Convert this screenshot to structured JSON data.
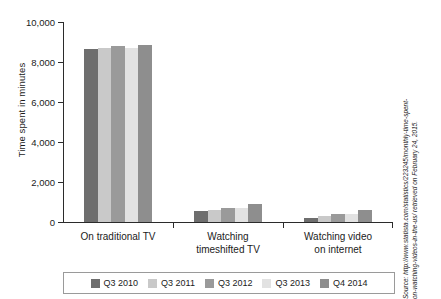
{
  "chart_data": {
    "type": "bar",
    "title": "",
    "xlabel": "",
    "ylabel": "Time spent in minutes",
    "ylim": [
      0,
      10000
    ],
    "yticks": [
      "0",
      "2,000",
      "4,000",
      "6,000",
      "8,000",
      "10,000"
    ],
    "ytick_values": [
      0,
      2000,
      4000,
      6000,
      8000,
      10000
    ],
    "grid": false,
    "legend_position": "bottom",
    "categories": [
      "On traditional TV",
      "Watching timeshifted TV",
      "Watching video on internet"
    ],
    "category_lines": [
      [
        "On traditional TV"
      ],
      [
        "Watching",
        "timeshifted TV"
      ],
      [
        "Watching video",
        "on internet"
      ]
    ],
    "series": [
      {
        "name": "Q3 2010",
        "color": "#6e6e6e",
        "values": [
          8650,
          540,
          190
        ]
      },
      {
        "name": "Q3 2011",
        "color": "#c9c9c9",
        "values": [
          8700,
          620,
          280
        ]
      },
      {
        "name": "Q3 2012",
        "color": "#9a9a9a",
        "values": [
          8780,
          680,
          380
        ]
      },
      {
        "name": "Q3 2013",
        "color": "#e2e2e2",
        "values": [
          8700,
          720,
          400
        ]
      },
      {
        "name": "Q4 2014",
        "color": "#8e8e8e",
        "values": [
          8840,
          920,
          580
        ]
      }
    ]
  },
  "source": {
    "line1": "Source: http://www.statista.com/statistics/223245/monthly-time-spent-",
    "line2": "on-watching-videos-in-the-us/ retrieved on February 24, 2015."
  }
}
